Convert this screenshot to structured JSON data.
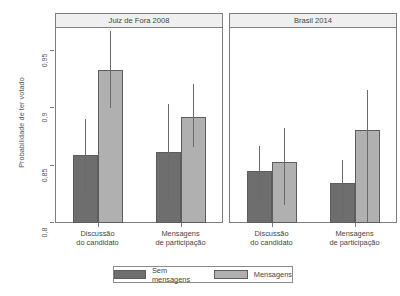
{
  "chart_data": {
    "type": "bar",
    "title": "",
    "xlabel": "",
    "ylabel": "Probabilidade de ter votado",
    "ylim": [
      0.8,
      0.97
    ],
    "yticks": [
      0.8,
      0.85,
      0.9,
      0.95
    ],
    "ytick_labels": [
      "0,8",
      "0,85",
      "0,9",
      "0,95"
    ],
    "grid": false,
    "legend_position": "bottom",
    "orientation": "vertical",
    "error_bars": "confidence-interval",
    "categories": [
      "Discussão\ndo candidato",
      "Mensagens\nde participação"
    ],
    "series": [
      {
        "name": "Sem mensagens",
        "color": "#6e6e6e"
      },
      {
        "name": "Mensagens",
        "color": "#b0b0b0"
      }
    ],
    "panels": [
      {
        "label": "Juiz de Fora 2008",
        "groups": [
          {
            "category": "Discussão\ndo candidato",
            "bars": [
              {
                "series": "Sem mensagens",
                "value": 0.859,
                "ci_low": 0.825,
                "ci_high": 0.891
              },
              {
                "series": "Mensagens",
                "value": 0.933,
                "ci_low": 0.9,
                "ci_high": 0.967
              }
            ]
          },
          {
            "category": "Mensagens\nde participação",
            "bars": [
              {
                "series": "Sem mensagens",
                "value": 0.862,
                "ci_low": 0.819,
                "ci_high": 0.904
              },
              {
                "series": "Mensagens",
                "value": 0.892,
                "ci_low": 0.866,
                "ci_high": 0.921
              }
            ]
          }
        ]
      },
      {
        "label": "Brasil 2014",
        "groups": [
          {
            "category": "Discussão\ndo candidato",
            "bars": [
              {
                "series": "Sem mensagens",
                "value": 0.845,
                "ci_low": 0.824,
                "ci_high": 0.867
              },
              {
                "series": "Mensagens",
                "value": 0.853,
                "ci_low": 0.816,
                "ci_high": 0.883
              }
            ]
          },
          {
            "category": "Mensagens\nde participação",
            "bars": [
              {
                "series": "Sem mensagens",
                "value": 0.835,
                "ci_low": 0.8,
                "ci_high": 0.855
              },
              {
                "series": "Mensagens",
                "value": 0.881,
                "ci_low": 0.8,
                "ci_high": 0.916
              }
            ]
          }
        ]
      }
    ]
  },
  "legend": {
    "items": [
      {
        "label": "Sem mensagens",
        "color": "#6e6e6e"
      },
      {
        "label": "Mensagens",
        "color": "#b0b0b0"
      }
    ]
  }
}
